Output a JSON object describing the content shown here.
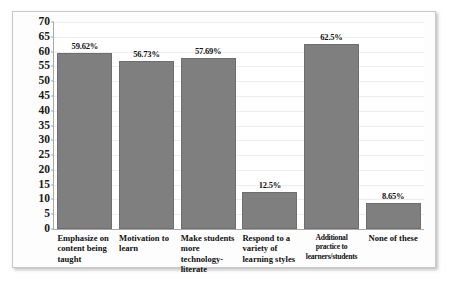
{
  "chart_data": {
    "type": "bar",
    "title": "",
    "subtitle": "",
    "xlabel": "",
    "ylabel": "",
    "ylim": [
      0,
      70
    ],
    "ytick_step": 5,
    "yticks": [
      "70",
      "65",
      "60",
      "55",
      "50",
      "45",
      "40",
      "35",
      "30",
      "25",
      "20",
      "15",
      "10",
      "5",
      "0"
    ],
    "grid": true,
    "legend": "none",
    "bar_color": "#7f7f7f",
    "categories": [
      "Emphasize on content being taught",
      "Motivation to learn",
      "Make students more technology-literate",
      "Respond to a variety of learning styles",
      "Additional practice to learners/students",
      "None of these"
    ],
    "values": [
      59.62,
      56.73,
      57.69,
      12.5,
      62.5,
      8.65
    ],
    "data_labels": [
      "59.62%",
      "56.73%",
      "57.69%",
      "12.5%",
      "62.5%",
      "8.65%"
    ]
  }
}
